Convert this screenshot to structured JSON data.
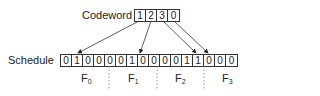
{
  "codeword": {
    "label": "Codeword",
    "digits": [
      "1",
      "2",
      "3",
      "0"
    ]
  },
  "schedule": {
    "label": "Schedule",
    "bits": [
      "0",
      "1",
      "0",
      "0",
      "0",
      "0",
      "1",
      "0",
      "0",
      "0",
      "0",
      "1",
      "1",
      "0",
      "0",
      "0"
    ]
  },
  "frames": [
    {
      "name": "F",
      "sub": "0"
    },
    {
      "name": "F",
      "sub": "1"
    },
    {
      "name": "F",
      "sub": "2"
    },
    {
      "name": "F",
      "sub": "3"
    }
  ],
  "mappings": [
    {
      "from_digit_index": 0,
      "value": "1",
      "to_bit_index": 1
    },
    {
      "from_digit_index": 1,
      "value": "2",
      "to_bit_index": 6
    },
    {
      "from_digit_index": 2,
      "value": "3",
      "to_bit_index": 11
    },
    {
      "from_digit_index": 3,
      "value": "0",
      "to_bit_index": 12
    }
  ]
}
